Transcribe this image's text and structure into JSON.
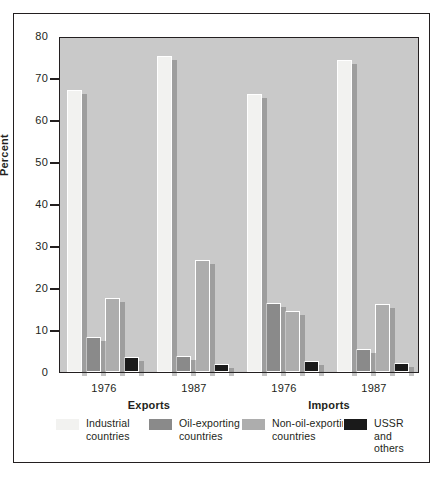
{
  "chart_data": {
    "type": "bar",
    "title": "",
    "subtitle": "",
    "xlabel": "",
    "ylabel": "Percent",
    "ylim": [
      0,
      80
    ],
    "yticks": [
      0,
      10,
      20,
      30,
      40,
      50,
      60,
      70,
      80
    ],
    "ytick_labels": [
      "0",
      "10",
      "20",
      "30",
      "40",
      "50",
      "60",
      "70",
      "80"
    ],
    "grid": false,
    "legend_position": "bottom",
    "categories": [
      "1976",
      "1987",
      "1976",
      "1987"
    ],
    "group_labels": [
      "Exports",
      "Imports"
    ],
    "groups": [
      {
        "section": "Exports",
        "year": "1976"
      },
      {
        "section": "Exports",
        "year": "1987"
      },
      {
        "section": "Imports",
        "year": "1976"
      },
      {
        "section": "Imports",
        "year": "1987"
      }
    ],
    "series": [
      {
        "name": "Industrial countries",
        "color": "#f2f2f0",
        "values": [
          67.2,
          75.2,
          66.2,
          74.3
        ]
      },
      {
        "name": "Oil-exporting countries",
        "color": "#8a8a8a",
        "values": [
          8.3,
          3.9,
          16.4,
          5.4
        ]
      },
      {
        "name": "Non-oil-exporting countries",
        "color": "#adadad",
        "values": [
          17.7,
          26.7,
          14.6,
          16.1
        ]
      },
      {
        "name": "USSR and others",
        "color": "#1a1a1a",
        "values": [
          3.6,
          1.9,
          2.6,
          2.1
        ]
      }
    ]
  },
  "legend": {
    "items": [
      {
        "label": "Industrial\ncountries"
      },
      {
        "label": "Oil-exporting\ncountries"
      },
      {
        "label": "Non-oil-exporting\ncountries"
      },
      {
        "label": "USSR\nand others"
      }
    ]
  },
  "colors": {
    "plot_background": "#c9c9c9",
    "frame": "#231f20",
    "page_background": "#ffffff",
    "text": "#231f20"
  }
}
